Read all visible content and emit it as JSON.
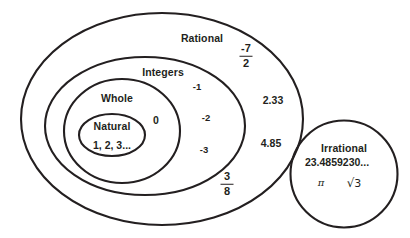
{
  "diagram": {
    "type": "nested-set-diagram",
    "stroke_color": "#231f20",
    "background_color": "#ffffff",
    "sets": [
      {
        "id": "rational",
        "label": "Rational",
        "shape": "ellipse",
        "contains": [
          "integers"
        ],
        "members": [
          "-7/2",
          "2.33",
          "4.85",
          "3/8"
        ]
      },
      {
        "id": "integers",
        "label": "Integers",
        "shape": "ellipse",
        "contains": [
          "whole"
        ],
        "members": [
          "-1",
          "-2",
          "-3"
        ]
      },
      {
        "id": "whole",
        "label": "Whole",
        "shape": "ellipse",
        "contains": [
          "natural"
        ],
        "members": [
          "0"
        ]
      },
      {
        "id": "natural",
        "label": "Natural",
        "shape": "ellipse",
        "contains": [],
        "members": [
          "1, 2, 3..."
        ]
      },
      {
        "id": "irrational",
        "label": "Irrational",
        "shape": "circle",
        "contains": [],
        "members": [
          "23.4859230...",
          "π",
          "√3"
        ]
      }
    ]
  },
  "labels": {
    "rational": "Rational",
    "integers": "Integers",
    "whole": "Whole",
    "natural": "Natural",
    "irrational": "Irrational"
  },
  "values": {
    "natural_list": "1, 2, 3...",
    "zero": "0",
    "neg_one": "-1",
    "neg_two": "-2",
    "neg_three": "-3",
    "two_point_three_three": "2.33",
    "four_point_eight_five": "4.85",
    "frac_neg_seven_halves": {
      "numerator": "-7",
      "denominator": "2"
    },
    "frac_three_eighths": {
      "numerator": "3",
      "denominator": "8"
    },
    "irrational_decimal": "23.4859230...",
    "pi": "π",
    "sqrt_three_radical": "√",
    "sqrt_three_operand": "3"
  }
}
